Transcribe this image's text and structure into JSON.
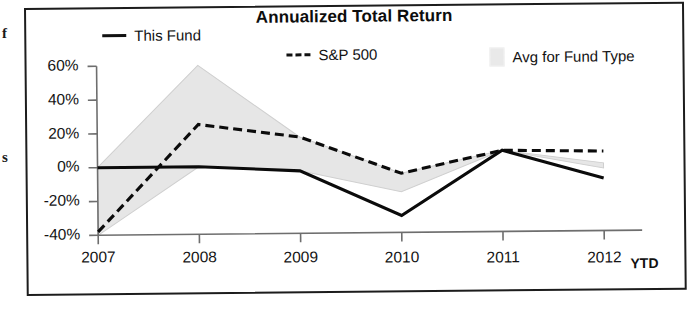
{
  "page_fragments": {
    "left_top": "f",
    "left_mid": "s"
  },
  "chart": {
    "title": "Annualized Total Return",
    "legend": [
      {
        "label": "This Fund",
        "marker": "solid-line-icon",
        "color": "#0b0b0b"
      },
      {
        "label": "S&P 500",
        "marker": "dashed-line-icon",
        "color": "#0b0b0b"
      },
      {
        "label": "Avg for Fund Type",
        "marker": "shaded-band-swatch-icon",
        "color": "#e6e6e6"
      }
    ],
    "y_axis": {
      "ticks": [
        "60%",
        "40%",
        "20%",
        "0%",
        "-20%",
        "-40%"
      ]
    },
    "x_axis": {
      "ticks": [
        "2007",
        "2008",
        "2009",
        "2010",
        "2011",
        "2012"
      ],
      "suffix_label": "YTD"
    }
  },
  "chart_data": {
    "type": "line",
    "title": "Annualized Total Return",
    "xlabel": "",
    "ylabel": "",
    "categories": [
      "2007",
      "2008",
      "2009",
      "2010",
      "2011",
      "2012"
    ],
    "x_axis_note": "2012 is YTD",
    "ylim": [
      -40,
      60
    ],
    "ytick_values": [
      60,
      40,
      20,
      0,
      -20,
      -40
    ],
    "ytick_labels": [
      "60%",
      "40%",
      "20%",
      "0%",
      "-20%",
      "-40%"
    ],
    "grid": false,
    "legend_position": "top",
    "series": [
      {
        "name": "This Fund",
        "style": "solid",
        "color": "#0b0b0b",
        "values": [
          0,
          0,
          -3,
          -30,
          8,
          -9
        ]
      },
      {
        "name": "S&P 500",
        "style": "dashed",
        "color": "#0b0b0b",
        "values": [
          -38,
          25,
          17,
          -5,
          8,
          7
        ]
      },
      {
        "name": "Avg for Fund Type",
        "style": "shaded-band",
        "color": "#e6e6e6",
        "band_upper": [
          0,
          60,
          17,
          -5,
          8,
          0
        ],
        "band_lower": [
          -40,
          0,
          -3,
          -16,
          8,
          -3
        ]
      }
    ]
  }
}
